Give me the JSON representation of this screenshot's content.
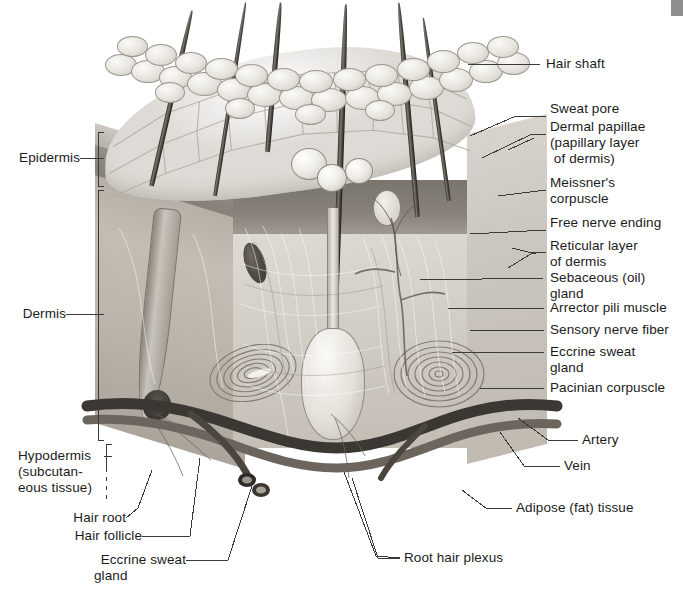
{
  "figure": {
    "style": "grayscale anatomical illustration"
  },
  "labels_right": [
    {
      "id": "hair-shaft",
      "text": "Hair shaft"
    },
    {
      "id": "sweat-pore",
      "text": "Sweat pore"
    },
    {
      "id": "dermal-papillae",
      "text": "Dermal papillae"
    },
    {
      "id": "dermal-papillae-2",
      "text": "(papillary layer"
    },
    {
      "id": "dermal-papillae-3",
      "text": " of dermis)"
    },
    {
      "id": "meissners",
      "text": "Meissner's"
    },
    {
      "id": "meissners-2",
      "text": "corpuscle"
    },
    {
      "id": "free-nerve",
      "text": "Free nerve ending"
    },
    {
      "id": "reticular",
      "text": "Reticular layer"
    },
    {
      "id": "reticular-2",
      "text": "of dermis"
    },
    {
      "id": "sebaceous",
      "text": "Sebaceous (oil)"
    },
    {
      "id": "sebaceous-2",
      "text": "gland"
    },
    {
      "id": "arrector",
      "text": "Arrector pili muscle"
    },
    {
      "id": "sensory-nerve",
      "text": "Sensory nerve fiber"
    },
    {
      "id": "eccrine-right",
      "text": "Eccrine sweat"
    },
    {
      "id": "eccrine-right-2",
      "text": "gland"
    },
    {
      "id": "pacinian",
      "text": "Pacinian corpuscle"
    },
    {
      "id": "artery",
      "text": "Artery"
    },
    {
      "id": "vein",
      "text": "Vein"
    },
    {
      "id": "adipose",
      "text": "Adipose (fat) tissue"
    }
  ],
  "labels_left": [
    {
      "id": "epidermis",
      "text": "Epidermis"
    },
    {
      "id": "dermis",
      "text": "Dermis"
    },
    {
      "id": "hypodermis",
      "text": "Hypodermis"
    },
    {
      "id": "hypodermis-2",
      "text": "(subcutan-"
    },
    {
      "id": "hypodermis-3",
      "text": "eous tissue)"
    },
    {
      "id": "hair-root",
      "text": "Hair root"
    },
    {
      "id": "hair-follicle",
      "text": "Hair follicle"
    },
    {
      "id": "eccrine-left",
      "text": "Eccrine sweat"
    },
    {
      "id": "eccrine-left-2",
      "text": "gland"
    }
  ],
  "labels_bottom": [
    {
      "id": "root-hair-plexus",
      "text": "Root hair plexus"
    }
  ],
  "colors": {
    "background": "#ffffff",
    "text": "#1b1b1b",
    "leader": "#3a3a3a",
    "artifact": "#8d8d8d"
  }
}
